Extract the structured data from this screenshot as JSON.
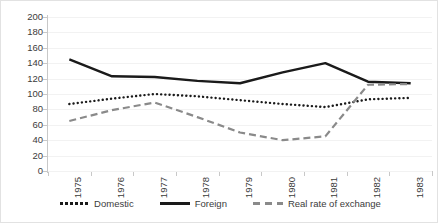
{
  "chart_data": {
    "type": "line",
    "title": "",
    "xlabel": "",
    "ylabel": "",
    "categories": [
      "1975",
      "1976",
      "1977",
      "1978",
      "1979",
      "1980",
      "1981",
      "1982",
      "1983"
    ],
    "ylim": [
      0,
      200
    ],
    "yticks": [
      0,
      20,
      40,
      60,
      80,
      100,
      120,
      140,
      160,
      180,
      200
    ],
    "grid": true,
    "legend_position": "bottom",
    "series": [
      {
        "name": "Domestic",
        "style": "dotted",
        "color": "#1a1a1a",
        "values": [
          87,
          94,
          100,
          97,
          92,
          87,
          83,
          93,
          95
        ]
      },
      {
        "name": "Foreign",
        "style": "solid",
        "color": "#1a1a1a",
        "values": [
          145,
          123,
          122,
          117,
          114,
          128,
          140,
          116,
          114
        ]
      },
      {
        "name": "Real rate of exchange",
        "style": "dashed",
        "color": "#8a8a8a",
        "values": [
          65,
          79,
          89,
          70,
          50,
          40,
          45,
          112,
          113
        ]
      }
    ]
  },
  "legend": {
    "items": [
      {
        "label": "Domestic",
        "swatch": "dotted-line-swatch"
      },
      {
        "label": "Foreign",
        "swatch": "solid-line-swatch"
      },
      {
        "label": "Real rate of exchange",
        "swatch": "dashed-line-swatch"
      }
    ]
  }
}
